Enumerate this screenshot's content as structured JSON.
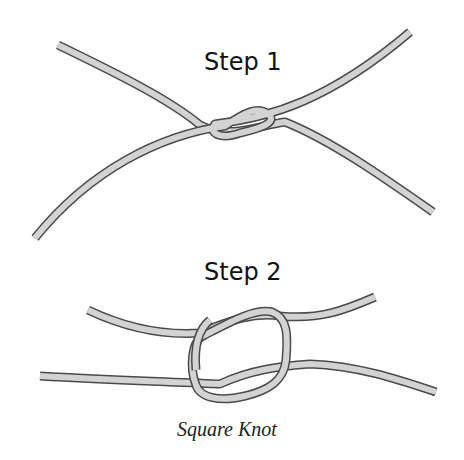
{
  "diagram": {
    "title": "Square Knot",
    "steps": [
      {
        "label": "Step 1"
      },
      {
        "label": "Step 2"
      }
    ],
    "colors": {
      "rope_fill": "#d3d3d3",
      "rope_outline": "#4a4a4a",
      "background": "#ffffff",
      "text": "#111111"
    }
  }
}
